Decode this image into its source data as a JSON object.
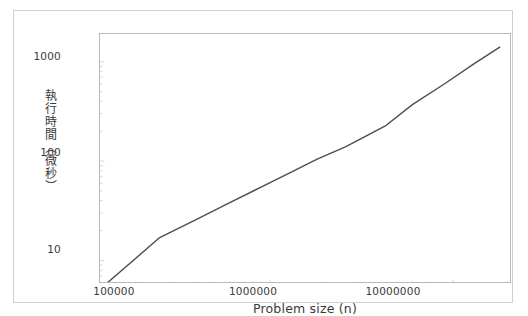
{
  "figure": {
    "background": "#ffffff",
    "outer_border_color": "#d0d0d0",
    "plot_border_color": "#b9b9b9"
  },
  "chart_data": {
    "type": "line",
    "title": "",
    "xlabel": "Problem size (n)",
    "ylabel": "執行時間（微秒）",
    "xscale": "log",
    "yscale": "log",
    "xlim": [
      118000,
      21000000
    ],
    "ylim": [
      5.8,
      1900
    ],
    "grid": false,
    "legend": null,
    "line_color": "#4c4c52",
    "line_width": 1.4,
    "xticks": [
      100000,
      1000000,
      10000000
    ],
    "xticklabels": [
      "100000",
      "1000000",
      "10000000"
    ],
    "yticks": [
      10,
      100,
      1000
    ],
    "yticklabels": [
      "10",
      "100",
      "1000"
    ],
    "series": [
      {
        "name": "execution time",
        "x": [
          130000,
          250000,
          400000,
          600000,
          900000,
          1300000,
          1800000,
          2600000,
          4300000,
          6000000,
          9000000,
          13000000,
          18000000
        ],
        "y": [
          6.0,
          17.0,
          26.0,
          38.0,
          55.0,
          77.0,
          104.0,
          140.0,
          228.0,
          370.0,
          600.0,
          950.0,
          1400.0
        ]
      }
    ]
  }
}
